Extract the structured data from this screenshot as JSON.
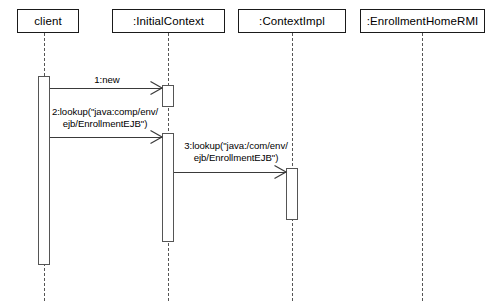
{
  "diagram": {
    "type": "uml-sequence-diagram",
    "width": 492,
    "height": 301,
    "background_color": "#ffffff",
    "line_color": "#1a1a1a",
    "lifeline_color": "#555555"
  },
  "participants": [
    {
      "id": "client",
      "label": "client",
      "box": {
        "x": 17,
        "y": 9,
        "width": 62,
        "height": 24
      },
      "lifeline_x": 44
    },
    {
      "id": "initial-context",
      "label": ":InitialContext",
      "box": {
        "x": 112,
        "y": 9,
        "width": 113,
        "height": 24
      },
      "lifeline_x": 168
    },
    {
      "id": "context-impl",
      "label": ":ContextImpl",
      "box": {
        "x": 238,
        "y": 9,
        "width": 108,
        "height": 24
      },
      "lifeline_x": 292
    },
    {
      "id": "enrollment-home-rmi",
      "label": ":EnrollmentHomeRMI",
      "box": {
        "x": 360,
        "y": 9,
        "width": 125,
        "height": 24
      },
      "lifeline_x": 422
    }
  ],
  "activations": [
    {
      "id": "activation-client",
      "participant": "client",
      "x": 38,
      "y": 76,
      "width": 12,
      "height": 189
    },
    {
      "id": "activation-initial-context-1",
      "participant": "initial-context",
      "x": 162,
      "y": 85,
      "width": 12,
      "height": 22
    },
    {
      "id": "activation-initial-context-2",
      "participant": "initial-context",
      "x": 162,
      "y": 133,
      "width": 12,
      "height": 109
    },
    {
      "id": "activation-context-impl",
      "participant": "context-impl",
      "x": 286,
      "y": 168,
      "width": 12,
      "height": 52
    }
  ],
  "messages": [
    {
      "id": "message-1",
      "sequence": "1",
      "label": "1:new",
      "from": "client",
      "to": "initial-context",
      "x_start": 50,
      "x_end": 162,
      "y": 88,
      "label_x": 62,
      "label_y": 74,
      "label_width": 90
    },
    {
      "id": "message-2",
      "sequence": "2",
      "label": "2:lookup(\"java:comp/env/\nejb/EnrollmentEJB\")",
      "from": "client",
      "to": "initial-context",
      "x_start": 50,
      "x_end": 162,
      "y": 137,
      "label_x": 36,
      "label_y": 106,
      "label_width": 138
    },
    {
      "id": "message-3",
      "sequence": "3",
      "label": "3:lookup(\"java:/com/env/\nejb/EnrollmentEJB\")",
      "from": "initial-context",
      "to": "context-impl",
      "x_start": 174,
      "x_end": 286,
      "y": 172,
      "label_x": 172,
      "label_y": 140,
      "label_width": 128
    }
  ]
}
